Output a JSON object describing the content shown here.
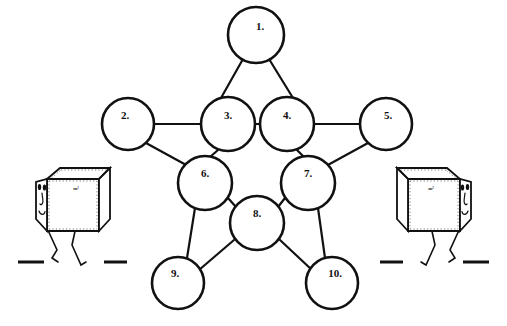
{
  "figure": {
    "background_color": "#ffffff",
    "stroke_color": "#111111",
    "fill_color": "#ffffff"
  },
  "diagram": {
    "type": "node-link-graph",
    "node_radius": 27,
    "nodes": [
      {
        "id": "1",
        "label": "1.",
        "cx": 256,
        "cy": 35,
        "r": 28,
        "label_dx": 4,
        "label_dy": -8
      },
      {
        "id": "2",
        "label": "2.",
        "cx": 128,
        "cy": 124,
        "r": 26,
        "label_dx": -3,
        "label_dy": -8
      },
      {
        "id": "3",
        "label": "3.",
        "cx": 228,
        "cy": 124,
        "r": 27,
        "label_dx": 0,
        "label_dy": -8
      },
      {
        "id": "4",
        "label": "4.",
        "cx": 287,
        "cy": 124,
        "r": 27,
        "label_dx": 0,
        "label_dy": -8
      },
      {
        "id": "5",
        "label": "5.",
        "cx": 386,
        "cy": 124,
        "r": 26,
        "label_dx": 2,
        "label_dy": -8
      },
      {
        "id": "6",
        "label": "6.",
        "cx": 205,
        "cy": 183,
        "r": 27,
        "label_dx": 0,
        "label_dy": -9
      },
      {
        "id": "7",
        "label": "7.",
        "cx": 308,
        "cy": 183,
        "r": 27,
        "label_dx": 0,
        "label_dy": -9
      },
      {
        "id": "8",
        "label": "8.",
        "cx": 257,
        "cy": 223,
        "r": 27,
        "label_dx": 0,
        "label_dy": -9
      },
      {
        "id": "9",
        "label": "9.",
        "cx": 178,
        "cy": 283,
        "r": 26,
        "label_dx": -3,
        "label_dy": -9
      },
      {
        "id": "10",
        "label": "10.",
        "cx": 332,
        "cy": 283,
        "r": 26,
        "label_dx": 3,
        "label_dy": -9
      }
    ],
    "edges": [
      {
        "from": "1",
        "to": "3"
      },
      {
        "from": "1",
        "to": "4"
      },
      {
        "from": "2",
        "to": "3"
      },
      {
        "from": "2",
        "to": "6"
      },
      {
        "from": "3",
        "to": "4"
      },
      {
        "from": "3",
        "to": "6"
      },
      {
        "from": "4",
        "to": "5"
      },
      {
        "from": "4",
        "to": "7"
      },
      {
        "from": "5",
        "to": "7"
      },
      {
        "from": "6",
        "to": "8"
      },
      {
        "from": "6",
        "to": "9"
      },
      {
        "from": "7",
        "to": "8"
      },
      {
        "from": "7",
        "to": "10"
      },
      {
        "from": "8",
        "to": "9"
      },
      {
        "from": "8",
        "to": "10"
      }
    ]
  },
  "characters": {
    "left_cube": {
      "name": "left-cube-character",
      "face_side": "left",
      "face_text": "m²",
      "ground_dashes": 2
    },
    "right_cube": {
      "name": "right-cube-character",
      "face_side": "right",
      "face_text": "m²",
      "ground_dashes": 2
    }
  }
}
